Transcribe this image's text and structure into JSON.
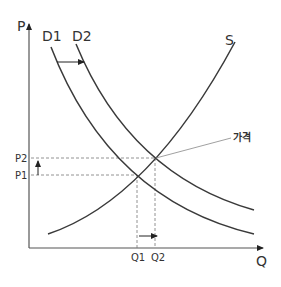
{
  "diagram": {
    "type": "supply-demand",
    "axes": {
      "y_label": "P",
      "x_label": "Q"
    },
    "curves": [
      {
        "id": "D1",
        "label": "D1",
        "kind": "demand"
      },
      {
        "id": "D2",
        "label": "D2",
        "kind": "demand"
      },
      {
        "id": "S",
        "label": "S",
        "kind": "supply"
      }
    ],
    "price_ticks": [
      "P2",
      "P1"
    ],
    "quantity_ticks": [
      "Q1",
      "Q2"
    ],
    "annotation": "가격",
    "shift": "D1 → D2 (demand increase)",
    "colors": {
      "curve": "#3a3a3a",
      "axis": "#555555",
      "dashed": "#777777",
      "annotation_line": "#888888"
    }
  }
}
